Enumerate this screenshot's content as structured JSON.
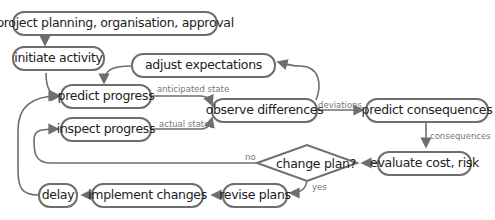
{
  "nodes": {
    "planning": "project planning, organisation, approval",
    "initiate": "initiate activity",
    "adjust": "adjust expectations",
    "predict_progress": "predict progress",
    "inspect": "inspect progress",
    "observe": "observe differences",
    "predict_consequences": "predict consequences",
    "evaluate": "evaluate cost, risk",
    "change_plan": "change plan?",
    "revise": "revise plans",
    "implement": "implement changes",
    "delay": "delay"
  },
  "edges": {
    "anticipated_state": "anticipated state",
    "actual_state": "actual state",
    "deviations": "deviations",
    "consequences": "consequences",
    "no": "no",
    "yes": "yes"
  },
  "colors": {
    "stroke": "#6e6e6e",
    "text": "#222222",
    "label": "#777777"
  }
}
